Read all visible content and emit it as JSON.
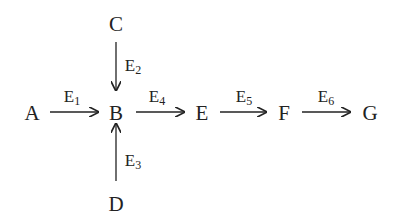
{
  "diagram": {
    "nodes": [
      {
        "id": "A",
        "label": "A",
        "x": 32,
        "y": 113
      },
      {
        "id": "B",
        "label": "B",
        "x": 116,
        "y": 113
      },
      {
        "id": "C",
        "label": "C",
        "x": 116,
        "y": 24
      },
      {
        "id": "D",
        "label": "D",
        "x": 116,
        "y": 204
      },
      {
        "id": "E",
        "label": "E",
        "x": 202,
        "y": 113
      },
      {
        "id": "F",
        "label": "F",
        "x": 284,
        "y": 113
      },
      {
        "id": "G",
        "label": "G",
        "x": 370,
        "y": 113
      }
    ],
    "edges": [
      {
        "from": "A",
        "to": "B",
        "label_main": "E",
        "label_sub": "1"
      },
      {
        "from": "C",
        "to": "B",
        "label_main": "E",
        "label_sub": "2"
      },
      {
        "from": "D",
        "to": "B",
        "label_main": "E",
        "label_sub": "3"
      },
      {
        "from": "B",
        "to": "E",
        "label_main": "E",
        "label_sub": "4"
      },
      {
        "from": "E",
        "to": "F",
        "label_main": "E",
        "label_sub": "5"
      },
      {
        "from": "F",
        "to": "G",
        "label_main": "E",
        "label_sub": "6"
      }
    ]
  }
}
